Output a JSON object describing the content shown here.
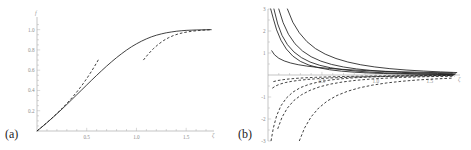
{
  "figure": {
    "background": "#ffffff",
    "curve_color": "#1f1f1f",
    "axis_color": "#9d9d9d",
    "tick_label_color": "#8a8a8a"
  },
  "panels": [
    {
      "id": "a",
      "label": "(a)",
      "xlabel": "ζ",
      "ylabel": "f"
    },
    {
      "id": "b",
      "label": "(b)",
      "xlabel": "ζ",
      "ylabel": ""
    }
  ],
  "chart_data": [
    {
      "type": "line",
      "panel": "a",
      "title": "",
      "xlabel": "ζ",
      "ylabel": "f",
      "xlim": [
        0,
        1.78
      ],
      "ylim": [
        0,
        1.12
      ],
      "xticks": [
        0.5,
        1.0,
        1.5
      ],
      "xtick_labels": [
        "0.5",
        "1.0",
        "1.5"
      ],
      "xminor_ticks": [
        0.1,
        0.2,
        0.3,
        0.4,
        0.6,
        0.7,
        0.8,
        0.9,
        1.1,
        1.2,
        1.3,
        1.4,
        1.6,
        1.7
      ],
      "yticks": [
        0.2,
        0.4,
        0.6,
        0.8,
        1.0
      ],
      "ytick_labels": [
        "0.2",
        "0.4",
        "0.6",
        "0.8",
        "1.0"
      ],
      "yminor_ticks": [
        0.05,
        0.1,
        0.15,
        0.25,
        0.3,
        0.35,
        0.45,
        0.5,
        0.55,
        0.65,
        0.7,
        0.75,
        0.85,
        0.9,
        0.95,
        1.05
      ],
      "grid": false,
      "legend": "none",
      "series": [
        {
          "name": "exact-solution",
          "style": "solid",
          "x": [
            0.0,
            0.05,
            0.1,
            0.15,
            0.2,
            0.25,
            0.3,
            0.35,
            0.4,
            0.45,
            0.5,
            0.55,
            0.6,
            0.65,
            0.7,
            0.75,
            0.8,
            0.85,
            0.9,
            0.95,
            1.0,
            1.05,
            1.1,
            1.15,
            1.2,
            1.25,
            1.3,
            1.35,
            1.4,
            1.45,
            1.5,
            1.55,
            1.6,
            1.65,
            1.7,
            1.75
          ],
          "y": [
            0.0,
            0.04,
            0.082,
            0.125,
            0.17,
            0.215,
            0.262,
            0.31,
            0.358,
            0.406,
            0.454,
            0.502,
            0.549,
            0.595,
            0.64,
            0.683,
            0.724,
            0.762,
            0.798,
            0.831,
            0.86,
            0.886,
            0.909,
            0.929,
            0.945,
            0.958,
            0.969,
            0.977,
            0.984,
            0.989,
            0.993,
            0.995,
            0.997,
            0.998,
            0.999,
            1.0
          ]
        },
        {
          "name": "small-zeta-expansion",
          "style": "dashed",
          "x": [
            0.0,
            0.05,
            0.1,
            0.15,
            0.2,
            0.25,
            0.3,
            0.35,
            0.4,
            0.45,
            0.5,
            0.55,
            0.6,
            0.62
          ],
          "y": [
            0.0,
            0.041,
            0.083,
            0.127,
            0.173,
            0.221,
            0.272,
            0.326,
            0.385,
            0.448,
            0.517,
            0.592,
            0.673,
            0.708
          ]
        },
        {
          "name": "large-zeta-expansion",
          "style": "dashed",
          "x": [
            1.07,
            1.12,
            1.17,
            1.22,
            1.27,
            1.32,
            1.37,
            1.42,
            1.47,
            1.52,
            1.57,
            1.62,
            1.67,
            1.72,
            1.76
          ],
          "y": [
            0.7,
            0.76,
            0.812,
            0.855,
            0.891,
            0.919,
            0.941,
            0.958,
            0.97,
            0.979,
            0.986,
            0.991,
            0.995,
            0.998,
            1.0
          ]
        }
      ]
    },
    {
      "type": "line",
      "panel": "b",
      "title": "",
      "xlabel": "ζ",
      "ylabel": "",
      "xlim": [
        0,
        1.78
      ],
      "ylim": [
        -3,
        3
      ],
      "xticks": [
        0.5,
        1.0,
        1.5
      ],
      "xtick_labels": [
        "0.5",
        "1.0",
        "1.5"
      ],
      "xminor_ticks": [
        0.1,
        0.2,
        0.3,
        0.4,
        0.6,
        0.7,
        0.8,
        0.9,
        1.1,
        1.2,
        1.3,
        1.4,
        1.6,
        1.7
      ],
      "yticks": [
        -3,
        -2,
        -1,
        1,
        2,
        3
      ],
      "ytick_labels": [
        "-3",
        "-2",
        "-1",
        "1",
        "2",
        "3"
      ],
      "yminor_ticks": [
        -2.5,
        -1.5,
        -0.5,
        0.5,
        1.5,
        2.5
      ],
      "grid": false,
      "legend": "none",
      "series": [
        {
          "name": "solid-curve-1",
          "style": "solid",
          "x": [
            0.025,
            0.05,
            0.08,
            0.12,
            0.17,
            0.23,
            0.3,
            0.38,
            0.47,
            0.57,
            0.68,
            0.8,
            0.93,
            1.07,
            1.22,
            1.38,
            1.55,
            1.72
          ],
          "y": [
            3.0,
            2.55,
            2.05,
            1.58,
            1.18,
            0.86,
            0.62,
            0.45,
            0.33,
            0.24,
            0.175,
            0.128,
            0.093,
            0.068,
            0.049,
            0.035,
            0.025,
            0.018
          ]
        },
        {
          "name": "solid-curve-2",
          "style": "solid",
          "x": [
            0.055,
            0.09,
            0.13,
            0.18,
            0.24,
            0.31,
            0.39,
            0.48,
            0.58,
            0.69,
            0.81,
            0.94,
            1.08,
            1.23,
            1.39,
            1.56,
            1.73
          ],
          "y": [
            3.0,
            2.32,
            1.8,
            1.38,
            1.05,
            0.79,
            0.59,
            0.44,
            0.33,
            0.245,
            0.181,
            0.134,
            0.099,
            0.073,
            0.053,
            0.039,
            0.028
          ]
        },
        {
          "name": "solid-curve-3",
          "style": "solid",
          "x": [
            0.1,
            0.14,
            0.19,
            0.25,
            0.32,
            0.4,
            0.49,
            0.59,
            0.7,
            0.82,
            0.95,
            1.09,
            1.24,
            1.4,
            1.57,
            1.74
          ],
          "y": [
            3.0,
            2.38,
            1.85,
            1.42,
            1.09,
            0.83,
            0.63,
            0.48,
            0.365,
            0.277,
            0.21,
            0.159,
            0.12,
            0.091,
            0.069,
            0.052
          ]
        },
        {
          "name": "solid-curve-4",
          "style": "solid",
          "x": [
            0.18,
            0.23,
            0.29,
            0.36,
            0.44,
            0.53,
            0.63,
            0.74,
            0.86,
            0.99,
            1.13,
            1.28,
            1.44,
            1.6,
            1.75
          ],
          "y": [
            3.0,
            2.4,
            1.92,
            1.52,
            1.2,
            0.95,
            0.75,
            0.59,
            0.465,
            0.366,
            0.288,
            0.227,
            0.179,
            0.141,
            0.111
          ]
        },
        {
          "name": "solid-curve-5",
          "style": "solid",
          "x": [
            0.035,
            0.06,
            0.1,
            0.15,
            0.21,
            0.28,
            0.36,
            0.45,
            0.55,
            0.66,
            0.78,
            0.91,
            1.05,
            1.2,
            1.36,
            1.53,
            1.71
          ],
          "y": [
            1.1,
            0.92,
            0.76,
            0.64,
            0.545,
            0.468,
            0.405,
            0.352,
            0.306,
            0.266,
            0.231,
            0.2,
            0.173,
            0.15,
            0.13,
            0.112,
            0.097
          ]
        },
        {
          "name": "dashed-curve-1",
          "style": "dashed",
          "x": [
            0.028,
            0.05,
            0.08,
            0.12,
            0.17,
            0.23,
            0.3,
            0.38,
            0.47,
            0.57,
            0.68,
            0.8,
            0.93,
            1.07,
            1.22,
            1.38,
            1.55,
            1.72
          ],
          "y": [
            -3.0,
            -2.4,
            -1.85,
            -1.4,
            -1.05,
            -0.78,
            -0.575,
            -0.425,
            -0.315,
            -0.233,
            -0.172,
            -0.127,
            -0.094,
            -0.069,
            -0.051,
            -0.038,
            -0.028,
            -0.02
          ]
        },
        {
          "name": "dashed-curve-2",
          "style": "dashed",
          "x": [
            0.09,
            0.13,
            0.18,
            0.24,
            0.31,
            0.39,
            0.48,
            0.58,
            0.69,
            0.81,
            0.94,
            1.08,
            1.23,
            1.39,
            1.56,
            1.73
          ],
          "y": [
            -2.45,
            -1.92,
            -1.5,
            -1.16,
            -0.9,
            -0.695,
            -0.535,
            -0.413,
            -0.318,
            -0.245,
            -0.189,
            -0.146,
            -0.113,
            -0.087,
            -0.067,
            -0.052
          ]
        },
        {
          "name": "dashed-curve-3",
          "style": "dashed",
          "x": [
            0.29,
            0.34,
            0.4,
            0.47,
            0.55,
            0.64,
            0.74,
            0.85,
            0.97,
            1.1,
            1.24,
            1.39,
            1.55,
            1.72
          ],
          "y": [
            -3.0,
            -2.4,
            -1.9,
            -1.5,
            -1.18,
            -0.93,
            -0.735,
            -0.58,
            -0.458,
            -0.361,
            -0.285,
            -0.225,
            -0.178,
            -0.14
          ]
        },
        {
          "name": "dashed-curve-4",
          "style": "dashed",
          "x": [
            0.04,
            0.07,
            0.11,
            0.16,
            0.22,
            0.29,
            0.37,
            0.46,
            0.56,
            0.67,
            0.79,
            0.92,
            1.06,
            1.21,
            1.37,
            1.54,
            1.71
          ],
          "y": [
            -0.6,
            -0.5,
            -0.415,
            -0.345,
            -0.288,
            -0.24,
            -0.2,
            -0.167,
            -0.139,
            -0.116,
            -0.096,
            -0.08,
            -0.067,
            -0.056,
            -0.046,
            -0.039,
            -0.032
          ]
        },
        {
          "name": "dashed-curve-5",
          "style": "dashed",
          "x": [
            0.05,
            0.09,
            0.14,
            0.2,
            0.27,
            0.35,
            0.44,
            0.54,
            0.65,
            0.77,
            0.9,
            1.04,
            1.19,
            1.35,
            1.52,
            1.7
          ],
          "y": [
            -0.3,
            -0.252,
            -0.212,
            -0.178,
            -0.15,
            -0.126,
            -0.106,
            -0.089,
            -0.075,
            -0.063,
            -0.053,
            -0.044,
            -0.037,
            -0.031,
            -0.026,
            -0.022
          ]
        }
      ]
    }
  ]
}
